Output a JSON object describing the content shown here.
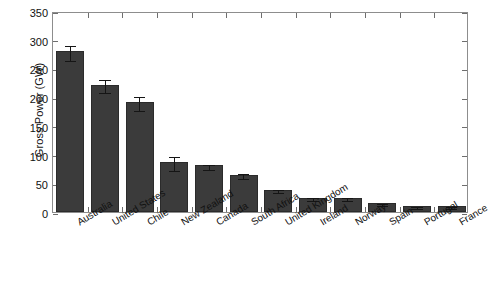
{
  "chart_data": {
    "type": "bar",
    "title": "",
    "subtitle": "",
    "xlabel": "",
    "ylabel": "Gross Power (GW)",
    "ylim": [
      0,
      350
    ],
    "yticks": [
      0,
      50,
      100,
      150,
      200,
      250,
      300,
      350
    ],
    "ytick_labels": [
      "0",
      "50",
      "100",
      "150",
      "200",
      "250",
      "300",
      "350"
    ],
    "grid": false,
    "legend": false,
    "legend_position": "none",
    "error_bars": true,
    "bar_color": "#3b3b3b",
    "frame_color": "#8d8d8d",
    "categories": [
      "Australia",
      "United States",
      "Chile",
      "New Zealand",
      "Canada",
      "South Africa",
      "United Kingdom",
      "Ireland",
      "Norway",
      "Spain",
      "Portugal",
      "France"
    ],
    "values": [
      280,
      222,
      192,
      87,
      81,
      65,
      39,
      25,
      25,
      16,
      11,
      10
    ],
    "errors": [
      13,
      12,
      12,
      12,
      5,
      4,
      3,
      3,
      3,
      2,
      2,
      2
    ]
  }
}
